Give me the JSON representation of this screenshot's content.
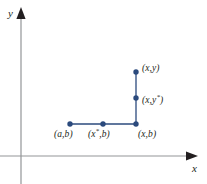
{
  "figure": {
    "background_color": "#ffffff",
    "axis_color": "#939598",
    "marker_color": "#2b4a7d",
    "segment_color": "#2b4a7d",
    "text_color": "#231f20",
    "axes": {
      "x_label": "x",
      "y_label": "y",
      "origin": {
        "x": 21,
        "y": 156
      },
      "x_axis_end": {
        "x": 196,
        "y": 156
      },
      "y_axis_end": {
        "x": 21,
        "y": 10
      }
    },
    "points": [
      {
        "name": "point-a-b",
        "label": "(a,b)",
        "sup": "",
        "cx": 70,
        "cy": 124
      },
      {
        "name": "point-xstar-b",
        "label": "(x",
        "sup": "*",
        "label_tail": ",b)",
        "cx": 103,
        "cy": 124
      },
      {
        "name": "point-x-b",
        "label": "(x,b)",
        "sup": "",
        "cx": 136,
        "cy": 124
      },
      {
        "name": "point-x-ystar",
        "label": "(x,y",
        "sup": "*",
        "label_tail": ")",
        "cx": 136,
        "cy": 98
      },
      {
        "name": "point-x-y",
        "label": "(x,y)",
        "sup": "",
        "cx": 136,
        "cy": 72
      }
    ],
    "segments": [
      {
        "name": "horizontal-segment",
        "x1": 70,
        "y1": 124,
        "x2": 136,
        "y2": 124
      },
      {
        "name": "vertical-segment",
        "x1": 136,
        "y1": 124,
        "x2": 136,
        "y2": 72
      }
    ],
    "labels": {
      "xy": {
        "prefix": "(x,y)",
        "sup": "",
        "suffix": ""
      },
      "xystar": {
        "prefix": "(x,y",
        "sup": "*",
        "suffix": ")"
      },
      "ab": {
        "prefix": "(a,b)",
        "sup": "",
        "suffix": ""
      },
      "xstarb": {
        "prefix": "(x",
        "sup": "*",
        "suffix": ",b)"
      },
      "xb": {
        "prefix": "(x,b)",
        "sup": "",
        "suffix": ""
      }
    }
  }
}
